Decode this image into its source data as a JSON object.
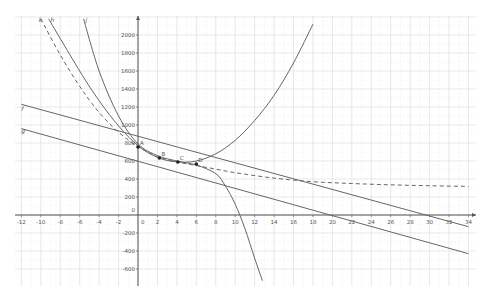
{
  "chart_data": {
    "type": "line",
    "title": "",
    "xlabel": "",
    "ylabel": "",
    "xlim": [
      -12,
      34
    ],
    "ylim": [
      -600,
      2000
    ],
    "grid": true,
    "x_ticks": [
      -12,
      -10,
      -8,
      -6,
      -4,
      -2,
      0,
      2,
      4,
      6,
      8,
      10,
      12,
      14,
      16,
      18,
      20,
      22,
      24,
      26,
      28,
      30,
      32,
      34
    ],
    "x_tick_labels": [
      "-12",
      "-10",
      "-8",
      "-6",
      "-4",
      "-2",
      "0",
      "2",
      "4",
      "6",
      "8",
      "10",
      "12",
      "14",
      "16",
      "18",
      "20",
      "22",
      "24",
      "26",
      "28",
      "30",
      "32",
      "34"
    ],
    "y_ticks": [
      -600,
      -400,
      -200,
      0,
      200,
      400,
      600,
      800,
      1000,
      1200,
      1400,
      1600,
      1800,
      2000
    ],
    "y_tick_labels": [
      "-600",
      "-400",
      "-200",
      "0",
      "200",
      "400",
      "600",
      "800",
      "1000",
      "1200",
      "1400",
      "1600",
      "1800",
      "2000"
    ],
    "points": [
      {
        "name": "A",
        "x": 0,
        "y": 756
      },
      {
        "name": "B",
        "x": 2.2,
        "y": 633
      },
      {
        "name": "C",
        "x": 4.1,
        "y": 589
      },
      {
        "name": "D",
        "x": 6,
        "y": 567
      }
    ],
    "series": [
      {
        "name": "f",
        "kind": "line",
        "style": "solid",
        "x": [
          -12,
          34
        ],
        "y": [
          1230,
          -130
        ]
      },
      {
        "name": "g",
        "kind": "line",
        "style": "solid",
        "x": [
          -12,
          34
        ],
        "y": [
          960,
          -430
        ]
      },
      {
        "name": "h",
        "kind": "curve",
        "style": "solid",
        "x": [
          -9.2,
          -6,
          -4,
          -2,
          0,
          2,
          4,
          6,
          8,
          10,
          12,
          14,
          16,
          18
        ],
        "y": [
          2180,
          1600,
          1270,
          990,
          770,
          640,
          590,
          600,
          680,
          830,
          1050,
          1330,
          1690,
          2120
        ]
      },
      {
        "name": "j",
        "kind": "curve",
        "style": "solid",
        "x": [
          -5.6,
          -4,
          -2,
          0,
          2,
          4,
          6,
          8,
          9,
          10,
          11,
          12,
          12.8
        ],
        "y": [
          2180,
          1600,
          1100,
          790,
          660,
          600,
          555,
          460,
          320,
          120,
          -150,
          -480,
          -730
        ]
      },
      {
        "name": "k",
        "kind": "curve",
        "style": "dashed",
        "x": [
          -10,
          -8,
          -6,
          -4,
          -2,
          0,
          2,
          4,
          6,
          8,
          10,
          14,
          18,
          22,
          26,
          30,
          34
        ],
        "y": [
          2180,
          1780,
          1430,
          1140,
          920,
          760,
          650,
          590,
          550,
          510,
          470,
          410,
          370,
          350,
          335,
          325,
          318
        ]
      }
    ],
    "curve_labels": [
      {
        "name": "k",
        "x": -10.2,
        "y": 2180
      },
      {
        "name": "h",
        "x": -9.0,
        "y": 2180
      },
      {
        "name": "j",
        "x": -5.4,
        "y": 2180
      },
      {
        "name": "f",
        "x": -12,
        "y": 1160
      },
      {
        "name": "g",
        "x": -12,
        "y": 910
      }
    ]
  },
  "colors": {
    "background": "#ffffff",
    "grid": "#d9d9d9",
    "axis": "#555555",
    "curve": "#666666",
    "point": "#222222",
    "text": "#555555"
  }
}
